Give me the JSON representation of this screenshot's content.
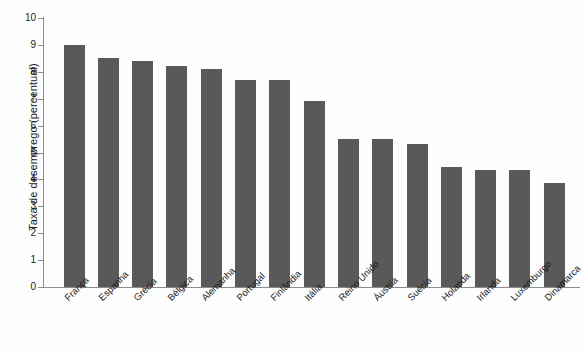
{
  "chart_data": {
    "type": "bar",
    "title": "",
    "subtitle": "",
    "xlabel": "",
    "ylabel": "Taxa de desemprego (percentual)",
    "ylim": [
      0,
      10
    ],
    "ytick_labels": [
      "0",
      "1",
      "2",
      "3",
      "4",
      "5",
      "6",
      "7",
      "8",
      "9",
      "10"
    ],
    "ytick_values": [
      0,
      1,
      2,
      3,
      4,
      5,
      6,
      7,
      8,
      9,
      10
    ],
    "grid": false,
    "legend": null,
    "orientation": "vertical",
    "bar_color": "#595959",
    "axis_color": "#8c8c8c",
    "background_color": "#fdfdfd",
    "categories": [
      "França",
      "Espanha",
      "Grécia",
      "Bélgica",
      "Alemanha",
      "Portugal",
      "Finlândia",
      "Itália",
      "Reino Unido",
      "Áustria",
      "Suécia",
      "Holanda",
      "Irlanda",
      "Luxemburgo",
      "Dinamarca"
    ],
    "values": [
      9.0,
      8.5,
      8.4,
      8.2,
      8.1,
      7.7,
      7.7,
      6.9,
      5.5,
      5.5,
      5.3,
      4.45,
      4.35,
      4.35,
      3.85
    ]
  }
}
